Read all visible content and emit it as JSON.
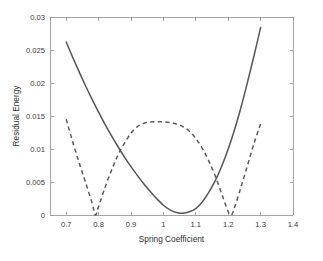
{
  "chart_data": {
    "type": "line",
    "title": "",
    "xlabel": "Spring Coefficient",
    "ylabel": "Residual Energy",
    "xlim": [
      0.65,
      1.4
    ],
    "ylim": [
      0,
      0.03
    ],
    "grid": false,
    "legend": "none",
    "xticks": [
      0.7,
      0.8,
      0.9,
      1.0,
      1.1,
      1.2,
      1.3,
      1.4
    ],
    "xtick_labels": [
      "0.7",
      "0.8",
      "0.9",
      "1",
      "1.1",
      "1.2",
      "1.3",
      "1.4"
    ],
    "yticks": [
      0,
      0.005,
      0.01,
      0.015,
      0.02,
      0.025,
      0.03
    ],
    "ytick_labels": [
      "0",
      "0.005",
      "0.01",
      "0.015",
      "0.02",
      "0.025",
      "0.03"
    ],
    "series": [
      {
        "name": "single-well residual",
        "style": "solid",
        "color": "#555555",
        "minimum_x": 1.0,
        "minimum_y": 0.0,
        "x": [
          0.7,
          0.72,
          0.74,
          0.76,
          0.78,
          0.8,
          0.82,
          0.84,
          0.86,
          0.88,
          0.9,
          0.92,
          0.94,
          0.96,
          0.98,
          1.0,
          1.02,
          1.04,
          1.06,
          1.08,
          1.1,
          1.12,
          1.14,
          1.16,
          1.18,
          1.2,
          1.22,
          1.24,
          1.26,
          1.28,
          1.3
        ],
        "y": [
          0.0262,
          0.0239,
          0.02168,
          0.01955,
          0.01752,
          0.01558,
          0.01374,
          0.01199,
          0.01034,
          0.00878,
          0.00732,
          0.00596,
          0.00469,
          0.00352,
          0.00245,
          0.00148,
          0.00078,
          0.00038,
          0.00028,
          0.00048,
          0.00098,
          0.00198,
          0.00342,
          0.0052,
          0.0074,
          0.01,
          0.013,
          0.0164,
          0.0202,
          0.0242,
          0.0284
        ]
      },
      {
        "name": "double-well residual",
        "style": "dashed",
        "color": "#5a5a5a",
        "zeros_x": [
          0.79,
          1.21
        ],
        "center_peak_x": 1.0,
        "center_peak_y": 0.0141,
        "x": [
          0.7,
          0.72,
          0.74,
          0.76,
          0.78,
          0.79,
          0.8,
          0.82,
          0.84,
          0.86,
          0.88,
          0.9,
          0.92,
          0.94,
          0.96,
          0.98,
          1.0,
          1.02,
          1.04,
          1.06,
          1.08,
          1.1,
          1.12,
          1.14,
          1.16,
          1.18,
          1.2,
          1.21,
          1.22,
          1.24,
          1.26,
          1.28,
          1.3
        ],
        "y": [
          0.0145,
          0.0111,
          0.0079,
          0.0049,
          0.0018,
          0.0,
          0.0013,
          0.0042,
          0.0068,
          0.0091,
          0.0109,
          0.0124,
          0.0134,
          0.0139,
          0.01408,
          0.01412,
          0.0141,
          0.014,
          0.0138,
          0.0134,
          0.0127,
          0.0116,
          0.0101,
          0.0082,
          0.0059,
          0.0032,
          0.0005,
          0.0,
          0.0012,
          0.0043,
          0.0076,
          0.0109,
          0.0138
        ]
      }
    ]
  }
}
